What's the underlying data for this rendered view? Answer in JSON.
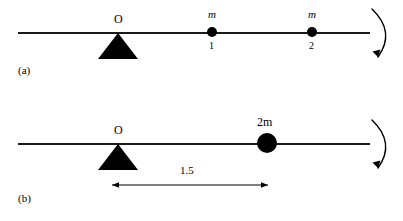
{
  "figure": {
    "type": "physics-diagram",
    "background_color": "#ffffff",
    "ink_color": "#000000",
    "width": 403,
    "height": 221
  },
  "panels": [
    {
      "id": "a",
      "label": "(a)",
      "pivot_label": "O",
      "beam": {
        "x1": 18,
        "x2": 370,
        "y": 32
      },
      "fulcrum": {
        "x": 118,
        "y": 33
      },
      "masses": [
        {
          "label": "m",
          "subscript": "1",
          "x": 212,
          "y": 32,
          "radius": 5
        },
        {
          "label": "m",
          "subscript": "2",
          "x": 312,
          "y": 32,
          "radius": 5
        }
      ],
      "rotation_arrow": {
        "direction": "clockwise",
        "x": 378,
        "y_top": 8,
        "y_bottom": 58
      }
    },
    {
      "id": "b",
      "label": "(b)",
      "pivot_label": "O",
      "beam": {
        "x1": 18,
        "x2": 370,
        "y": 33
      },
      "fulcrum": {
        "x": 118,
        "y": 34
      },
      "masses": [
        {
          "label": "2m",
          "subscript": "",
          "x": 267,
          "y": 33,
          "radius": 10
        }
      ],
      "dimension": {
        "value": "1.5",
        "x1": 112,
        "x2": 268,
        "y": 75
      },
      "rotation_arrow": {
        "direction": "clockwise",
        "x": 378,
        "y_top": 9,
        "y_bottom": 59
      }
    }
  ]
}
